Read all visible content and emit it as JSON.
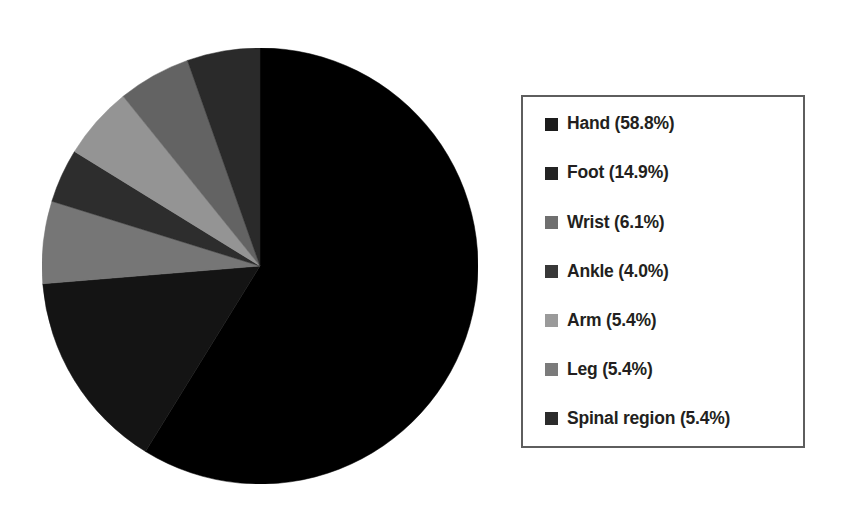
{
  "chart_data": {
    "type": "pie",
    "title": "",
    "subtitle": "",
    "xlabel": "",
    "ylabel": "",
    "grid": false,
    "legend_position": "right",
    "start_angle_deg": 0,
    "direction": "clockwise",
    "categories": [
      "Hand",
      "Foot",
      "Wrist",
      "Ankle",
      "Arm",
      "Leg",
      "Spinal region"
    ],
    "values": [
      58.8,
      14.9,
      6.1,
      4.0,
      5.4,
      5.4,
      5.4
    ],
    "value_unit": "%",
    "slice_colors": [
      "#000000",
      "#141414",
      "#767676",
      "#2d2d2d",
      "#949494",
      "#636363",
      "#2a2a2a"
    ],
    "slices": [
      {
        "label": "Hand",
        "value": 58.8,
        "display": "Hand (58.8%)",
        "color": "#000000"
      },
      {
        "label": "Foot",
        "value": 14.9,
        "display": "Foot (14.9%)",
        "color": "#141414"
      },
      {
        "label": "Wrist",
        "value": 6.1,
        "display": "Wrist (6.1%)",
        "color": "#767676"
      },
      {
        "label": "Ankle",
        "value": 4.0,
        "display": "Ankle (4.0%)",
        "color": "#2d2d2d"
      },
      {
        "label": "Arm",
        "value": 5.4,
        "display": "Arm (5.4%)",
        "color": "#949494"
      },
      {
        "label": "Leg",
        "value": 5.4,
        "display": "Leg (5.4%)",
        "color": "#636363"
      },
      {
        "label": "Spinal region",
        "value": 5.4,
        "display": "Spinal region (5.4%)",
        "color": "#2a2a2a"
      }
    ]
  },
  "legend": {
    "border_color": "#5e5e5e",
    "background": "#ffffff",
    "entries": [
      {
        "label": "Hand (58.8%)",
        "color": "#1c1c1c"
      },
      {
        "label": "Foot (14.9%)",
        "color": "#232323"
      },
      {
        "label": "Wrist (6.1%)",
        "color": "#6f6f6f"
      },
      {
        "label": "Ankle (4.0%)",
        "color": "#383838"
      },
      {
        "label": "Arm (5.4%)",
        "color": "#9a9a9a"
      },
      {
        "label": "Leg (5.4%)",
        "color": "#7b7b7b"
      },
      {
        "label": "Spinal region (5.4%)",
        "color": "#2b2b2b"
      }
    ]
  }
}
